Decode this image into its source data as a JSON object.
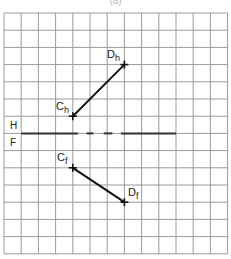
{
  "caption": "(a)",
  "grid": {
    "left": 4,
    "top": 13,
    "cell": 17.2,
    "cols": 13,
    "rows": 14,
    "line_color": "#9a9a9a"
  },
  "reference_line": {
    "label_above": "H",
    "label_below": "F",
    "row": 7,
    "col_start": 1,
    "col_end": 10,
    "segments": [
      [
        1,
        4.3
      ],
      [
        4.8,
        5.2
      ],
      [
        5.8,
        6.3
      ],
      [
        6.8,
        10
      ]
    ],
    "color": "#333333"
  },
  "lines": [
    {
      "view": "horizontal",
      "start": {
        "label": "C",
        "subscript": "h",
        "col": 4,
        "row": 6
      },
      "end": {
        "label": "D",
        "subscript": "h",
        "col": 7,
        "row": 3
      }
    },
    {
      "view": "frontal",
      "start": {
        "label": "C",
        "subscript": "f",
        "col": 4,
        "row": 9
      },
      "end": {
        "label": "D",
        "subscript": "f",
        "col": 7,
        "row": 11
      }
    }
  ],
  "labels": {
    "Ch": {
      "main": "C",
      "sub": "h"
    },
    "Dh": {
      "main": "D",
      "sub": "h"
    },
    "Cf": {
      "main": "C",
      "sub": "f"
    },
    "Df": {
      "main": "D",
      "sub": "f"
    },
    "H": "H",
    "F": "F"
  }
}
